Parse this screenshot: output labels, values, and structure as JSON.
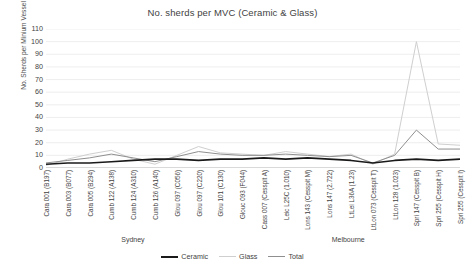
{
  "chart_data": {
    "type": "line",
    "title": "No. sherds per MVC (Ceramic & Glass)",
    "xlabel": "",
    "ylabel": "No. Sherds per Minium Vessel",
    "ylim": [
      0,
      110
    ],
    "yticks": [
      0,
      10,
      20,
      30,
      40,
      50,
      60,
      70,
      80,
      90,
      100,
      110
    ],
    "grid": true,
    "legend_position": "bottom",
    "categories": [
      "Cara 001 (B197)",
      "Cara 003 (B077)",
      "Cara 005 (B294)",
      "Cumb 122 (A138)",
      "Cumb 124 (A310)",
      "Cumb 126 (A140)",
      "Glou 097 (C056)",
      "Glou 097 (C220)",
      "Glou 101 (C130)",
      "Glouc 093 (F044)",
      "Cass 007 (Cesspit A)",
      "Leic L25C (1.010)",
      "Lons 143 (Cesspit M)",
      "Lons 147 (2.722)",
      "LtLei L36A (1.23)",
      "LtLon 073 (Cesspit T)",
      "LtLon 128 (1.023)",
      "Spri 147 (Cesspit B)",
      "Spri 255 (Cesspit H)",
      "Spri 255 (Cesspit I)"
    ],
    "series": [
      {
        "name": "Ceramic",
        "color": "#1a1a1a",
        "values": [
          3,
          4,
          4,
          5,
          6,
          7,
          7,
          6,
          7,
          7,
          8,
          7,
          8,
          7,
          6,
          4,
          6,
          7,
          6,
          7
        ]
      },
      {
        "name": "Glass",
        "color": "#cfcfcf",
        "values": [
          2,
          7,
          11,
          14,
          7,
          3,
          10,
          17,
          12,
          11,
          10,
          13,
          11,
          9,
          11,
          3,
          11,
          100,
          19,
          18
        ]
      },
      {
        "name": "Total",
        "color": "#8f8f8f",
        "values": [
          4,
          6,
          8,
          11,
          8,
          5,
          9,
          13,
          11,
          10,
          10,
          11,
          10,
          9,
          10,
          4,
          10,
          30,
          15,
          15
        ]
      }
    ],
    "group_labels": [
      {
        "label": "Sydney",
        "center_pct": 21
      },
      {
        "label": "Melbourne",
        "center_pct": 73
      }
    ]
  },
  "legend": {
    "entries": [
      {
        "label": "Ceramic"
      },
      {
        "label": "Glass"
      },
      {
        "label": "Total"
      }
    ]
  }
}
